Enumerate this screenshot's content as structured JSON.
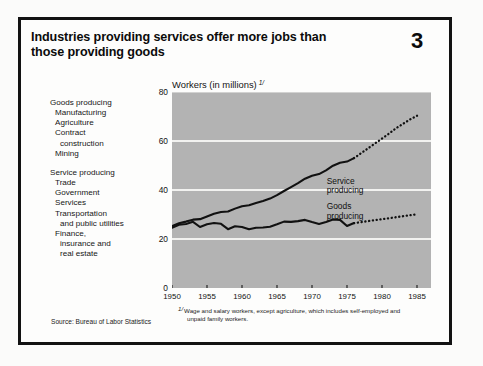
{
  "figure": {
    "title": "Industries providing services offer more jobs than those providing goods",
    "number": "3",
    "source": "Source: Bureau of Labor Statistics",
    "footnote_marker": "1/",
    "footnote_line1": "Wage and salary workers, except agriculture, which includes self-employed and",
    "footnote_line2": "unpaid family workers."
  },
  "legend": {
    "groups": [
      {
        "head": "Goods producing",
        "items": [
          {
            "text": "Manufacturing",
            "indent": 1
          },
          {
            "text": "Agriculture",
            "indent": 1
          },
          {
            "text": "Contract",
            "indent": 1
          },
          {
            "text": "construction",
            "indent": 2
          },
          {
            "text": "Mining",
            "indent": 1
          }
        ]
      },
      {
        "head": "Service producing",
        "items": [
          {
            "text": "Trade",
            "indent": 1
          },
          {
            "text": "Government",
            "indent": 1
          },
          {
            "text": "Services",
            "indent": 1
          },
          {
            "text": "Transportation",
            "indent": 1
          },
          {
            "text": "and public utilities",
            "indent": 2
          },
          {
            "text": "Finance,",
            "indent": 1
          },
          {
            "text": "insurance and",
            "indent": 2
          },
          {
            "text": "real estate",
            "indent": 2
          }
        ]
      }
    ]
  },
  "chart_data": {
    "type": "line",
    "title": "Industries providing services offer more jobs than those providing goods",
    "ylabel": "Workers (in millions)",
    "ylabel_footnote": "1/",
    "xlabel": "",
    "xlim": [
      1950,
      1987
    ],
    "ylim": [
      0,
      80
    ],
    "yticks": [
      0,
      20,
      40,
      60,
      80
    ],
    "xticks": [
      1950,
      1955,
      1960,
      1965,
      1970,
      1975,
      1980,
      1985
    ],
    "grid": "horizontal-white",
    "plot_background": "#b3b3b3",
    "line_color": "#111111",
    "projection_start_year": 1976,
    "legend_position": "inline",
    "series": [
      {
        "name": "Service producing",
        "label_line1": "Service",
        "label_line2": "producing",
        "style": "solid-then-dotted",
        "x": [
          1950,
          1951,
          1952,
          1953,
          1954,
          1955,
          1956,
          1957,
          1958,
          1959,
          1960,
          1961,
          1962,
          1963,
          1964,
          1965,
          1966,
          1967,
          1968,
          1969,
          1970,
          1971,
          1972,
          1973,
          1974,
          1975,
          1976
        ],
        "values": [
          25.3,
          26.4,
          27.1,
          27.9,
          28.1,
          29.2,
          30.3,
          31.0,
          31.2,
          32.4,
          33.4,
          33.8,
          34.7,
          35.5,
          36.5,
          37.9,
          39.6,
          41.2,
          42.8,
          44.6,
          45.8,
          46.5,
          48.0,
          49.9,
          51.1,
          51.6,
          53.0
        ]
      },
      {
        "name": "Service producing (projected)",
        "style": "dotted",
        "x": [
          1976,
          1977,
          1978,
          1979,
          1980,
          1981,
          1982,
          1983,
          1984,
          1985
        ],
        "values": [
          53.0,
          55.0,
          57.0,
          59.0,
          61.0,
          63.0,
          65.2,
          67.0,
          68.8,
          70.3
        ]
      },
      {
        "name": "Goods producing",
        "label_line1": "Goods",
        "label_line2": "producing",
        "style": "solid-then-dotted",
        "x": [
          1950,
          1951,
          1952,
          1953,
          1954,
          1955,
          1956,
          1957,
          1958,
          1959,
          1960,
          1961,
          1962,
          1963,
          1964,
          1965,
          1966,
          1967,
          1968,
          1969,
          1970,
          1971,
          1972,
          1973,
          1974,
          1975,
          1976
        ],
        "values": [
          24.6,
          25.8,
          26.1,
          27.0,
          24.9,
          26.0,
          26.5,
          26.2,
          24.0,
          25.2,
          24.9,
          24.0,
          24.6,
          24.7,
          25.0,
          26.0,
          27.1,
          27.0,
          27.3,
          27.8,
          26.9,
          26.1,
          26.9,
          28.0,
          27.8,
          25.3,
          26.5
        ]
      },
      {
        "name": "Goods producing (projected)",
        "style": "dotted",
        "x": [
          1976,
          1977,
          1978,
          1979,
          1980,
          1981,
          1982,
          1983,
          1984,
          1985
        ],
        "values": [
          26.5,
          26.9,
          27.3,
          27.7,
          28.1,
          28.5,
          28.9,
          29.3,
          29.7,
          30.1
        ]
      }
    ]
  }
}
